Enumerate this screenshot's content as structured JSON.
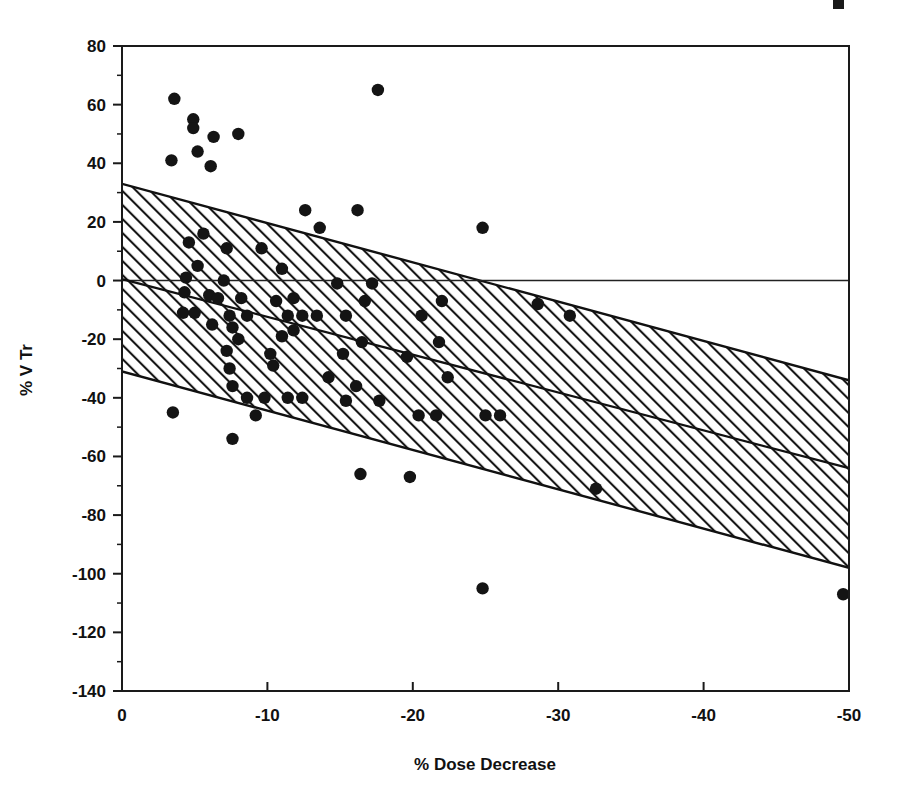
{
  "chart_data": {
    "type": "scatter",
    "title": "",
    "xlabel": "% Dose Decrease",
    "ylabel": "% V Tr",
    "xlim": [
      0,
      -50
    ],
    "ylim": [
      -140,
      80
    ],
    "x_ticks": [
      0,
      -10,
      -20,
      -30,
      -40,
      -50
    ],
    "x_tick_labels": [
      "0",
      "-10",
      "-20",
      "-30",
      "-40",
      "-50"
    ],
    "y_ticks": [
      80,
      60,
      40,
      20,
      0,
      -20,
      -40,
      -60,
      -80,
      -100,
      -120,
      -140
    ],
    "y_tick_labels": [
      "80",
      "60",
      "40",
      "20",
      "0",
      "-20",
      "-40",
      "-60",
      "-80",
      "-100",
      "-120",
      "-140"
    ],
    "grid": false,
    "legend": false,
    "zero_reference_line": {
      "y": 0,
      "description": "horizontal reference line at % V Tr = 0"
    },
    "regression_line": {
      "description": "fitted regression line through scatter",
      "x_start": 0,
      "y_start": 0.5,
      "x_end": -50,
      "y_end": -64.0
    },
    "confidence_band": {
      "description": "hatched prediction band around the regression line",
      "hatch": "diagonal-forward-slash",
      "upper_start": 33.0,
      "upper_end": -34.0,
      "lower_start": -31.0,
      "lower_end": -98.0
    },
    "points": [
      {
        "x": -3.6,
        "y": 62
      },
      {
        "x": -4.9,
        "y": 55
      },
      {
        "x": -4.9,
        "y": 52
      },
      {
        "x": -6.3,
        "y": 49
      },
      {
        "x": -8.0,
        "y": 50
      },
      {
        "x": -5.2,
        "y": 44
      },
      {
        "x": -3.4,
        "y": 41
      },
      {
        "x": -6.1,
        "y": 39
      },
      {
        "x": -17.6,
        "y": 65
      },
      {
        "x": -12.6,
        "y": 24
      },
      {
        "x": -16.2,
        "y": 24
      },
      {
        "x": -13.6,
        "y": 18
      },
      {
        "x": -24.8,
        "y": 18
      },
      {
        "x": -5.6,
        "y": 16
      },
      {
        "x": -4.6,
        "y": 13
      },
      {
        "x": -7.2,
        "y": 11
      },
      {
        "x": -9.6,
        "y": 11
      },
      {
        "x": -5.2,
        "y": 5
      },
      {
        "x": -11.0,
        "y": 4
      },
      {
        "x": -4.4,
        "y": 1
      },
      {
        "x": -7.0,
        "y": 0
      },
      {
        "x": -14.8,
        "y": -1
      },
      {
        "x": -17.2,
        "y": -1
      },
      {
        "x": -4.3,
        "y": -4
      },
      {
        "x": -6.0,
        "y": -5
      },
      {
        "x": -6.6,
        "y": -6
      },
      {
        "x": -8.2,
        "y": -6
      },
      {
        "x": -10.6,
        "y": -7
      },
      {
        "x": -11.8,
        "y": -6
      },
      {
        "x": -16.7,
        "y": -7
      },
      {
        "x": -22.0,
        "y": -7
      },
      {
        "x": -28.6,
        "y": -8
      },
      {
        "x": -4.2,
        "y": -11
      },
      {
        "x": -5.0,
        "y": -11
      },
      {
        "x": -7.4,
        "y": -12
      },
      {
        "x": -8.6,
        "y": -12
      },
      {
        "x": -11.4,
        "y": -12
      },
      {
        "x": -12.4,
        "y": -12
      },
      {
        "x": -13.4,
        "y": -12
      },
      {
        "x": -15.4,
        "y": -12
      },
      {
        "x": -20.6,
        "y": -12
      },
      {
        "x": -30.8,
        "y": -12
      },
      {
        "x": -6.2,
        "y": -15
      },
      {
        "x": -7.6,
        "y": -16
      },
      {
        "x": -11.8,
        "y": -17
      },
      {
        "x": -8.0,
        "y": -20
      },
      {
        "x": -11.0,
        "y": -19
      },
      {
        "x": -16.5,
        "y": -21
      },
      {
        "x": -21.8,
        "y": -21
      },
      {
        "x": -7.2,
        "y": -24
      },
      {
        "x": -10.2,
        "y": -25
      },
      {
        "x": -15.2,
        "y": -25
      },
      {
        "x": -19.6,
        "y": -26
      },
      {
        "x": -10.4,
        "y": -29
      },
      {
        "x": -7.4,
        "y": -30
      },
      {
        "x": -14.2,
        "y": -33
      },
      {
        "x": -22.4,
        "y": -33
      },
      {
        "x": -7.6,
        "y": -36
      },
      {
        "x": -16.1,
        "y": -36
      },
      {
        "x": -8.6,
        "y": -40
      },
      {
        "x": -9.8,
        "y": -40
      },
      {
        "x": -11.4,
        "y": -40
      },
      {
        "x": -12.4,
        "y": -40
      },
      {
        "x": -15.4,
        "y": -41
      },
      {
        "x": -17.7,
        "y": -41
      },
      {
        "x": -9.2,
        "y": -46
      },
      {
        "x": -20.4,
        "y": -46
      },
      {
        "x": -21.6,
        "y": -46
      },
      {
        "x": -25.0,
        "y": -46
      },
      {
        "x": -26.0,
        "y": -46
      },
      {
        "x": -3.5,
        "y": -45
      },
      {
        "x": -7.6,
        "y": -54
      },
      {
        "x": -16.4,
        "y": -66
      },
      {
        "x": -19.8,
        "y": -67
      },
      {
        "x": -32.6,
        "y": -71
      },
      {
        "x": -24.8,
        "y": -105
      },
      {
        "x": -49.6,
        "y": -107
      }
    ]
  },
  "axes": {
    "x_axis_title": "% Dose Decrease",
    "y_axis_title": "% V Tr"
  }
}
